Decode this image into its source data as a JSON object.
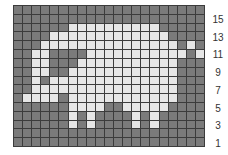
{
  "chart_grid": {
    "columns": 21,
    "rows": 16,
    "colors": {
      "dark": "#7b7b7b",
      "light": "#e6e6e6",
      "gridline": "#3c3c3c"
    },
    "light_cells_by_row": [
      [],
      [],
      [
        6,
        7,
        8,
        9,
        10,
        11,
        12,
        13,
        14,
        15
      ],
      [
        4,
        5,
        6,
        7,
        8,
        9,
        10,
        11,
        12,
        13,
        14,
        15,
        16
      ],
      [
        3,
        4,
        5,
        6,
        7,
        8,
        9,
        10,
        11,
        12,
        13,
        14,
        15,
        16,
        17,
        19
      ],
      [
        2,
        3,
        8,
        9,
        10,
        11,
        12,
        13,
        14,
        15,
        16,
        17,
        18,
        20
      ],
      [
        2,
        3,
        7,
        8,
        9,
        10,
        11,
        12,
        13,
        14,
        15,
        16,
        17
      ],
      [
        2,
        3,
        6,
        7,
        8,
        9,
        10,
        11,
        12,
        13,
        14,
        15,
        16,
        17
      ],
      [
        2,
        4,
        5,
        6,
        7,
        8,
        9,
        10,
        11,
        12,
        13,
        14,
        15,
        16,
        17
      ],
      [
        2,
        3,
        4,
        5,
        6,
        7,
        8,
        9,
        10,
        11,
        12,
        13,
        14,
        15,
        16,
        17
      ],
      [
        1,
        2,
        3,
        4,
        6,
        7,
        8,
        9,
        10,
        11,
        12,
        13,
        14,
        15,
        16,
        17
      ],
      [
        6,
        7,
        8,
        9,
        12,
        13,
        14,
        15,
        16
      ],
      [
        6,
        8,
        13,
        15
      ],
      [
        6,
        8,
        13,
        15
      ],
      [],
      []
    ]
  },
  "row_labels": [
    {
      "text": "15",
      "row_index": 1
    },
    {
      "text": "13",
      "row_index": 3
    },
    {
      "text": "11",
      "row_index": 5
    },
    {
      "text": "9",
      "row_index": 7
    },
    {
      "text": "7",
      "row_index": 9
    },
    {
      "text": "5",
      "row_index": 11
    },
    {
      "text": "3",
      "row_index": 13
    },
    {
      "text": "1",
      "row_index": 15
    }
  ]
}
